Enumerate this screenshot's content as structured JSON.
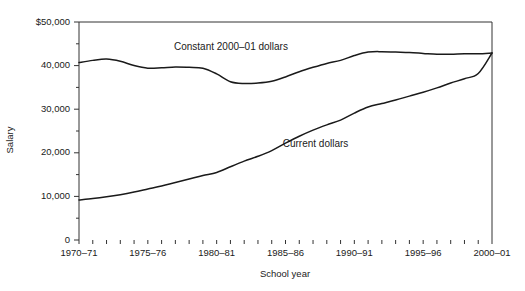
{
  "chart_data": {
    "type": "line",
    "title": "",
    "xlabel": "School year",
    "ylabel": "Salary",
    "ylim": [
      0,
      50000
    ],
    "grid": false,
    "legend_position": "inline-annotations",
    "y_tick_labels": [
      "$50,000",
      "40,000",
      "30,000",
      "20,000",
      "10,000",
      "0"
    ],
    "y_tick_values": [
      50000,
      40000,
      30000,
      20000,
      10000,
      0
    ],
    "y_minor_tick_values": [
      45000,
      35000,
      25000,
      15000,
      5000
    ],
    "x_tick_labels": [
      "1970–71",
      "1975–76",
      "1980–81",
      "1985–86",
      "1990–91",
      "1995–96",
      "2000–01"
    ],
    "x_tick_values": [
      1970,
      1975,
      1980,
      1985,
      1990,
      1995,
      2000
    ],
    "x": [
      1970,
      1971,
      1972,
      1973,
      1974,
      1975,
      1976,
      1977,
      1978,
      1979,
      1980,
      1981,
      1982,
      1983,
      1984,
      1985,
      1986,
      1987,
      1988,
      1989,
      1990,
      1991,
      1992,
      1993,
      1994,
      1995,
      1996,
      1997,
      1998,
      1999,
      2000
    ],
    "x_categories": [
      "1970–71",
      "1971–72",
      "1972–73",
      "1973–74",
      "1974–75",
      "1975–76",
      "1976–77",
      "1977–78",
      "1978–79",
      "1979–80",
      "1980–81",
      "1981–82",
      "1982–83",
      "1983–84",
      "1984–85",
      "1985–86",
      "1986–87",
      "1987–88",
      "1988–89",
      "1989–90",
      "1990–91",
      "1991–92",
      "1992–93",
      "1993–94",
      "1994–95",
      "1995–96",
      "1996–97",
      "1997–98",
      "1998–99",
      "1999–2000",
      "2000–01"
    ],
    "series": [
      {
        "name": "Constant 2000–01 dollars",
        "label_x": 1976.9,
        "label_y": 44200,
        "values": [
          40700,
          41200,
          41500,
          41000,
          40000,
          39400,
          39500,
          39700,
          39600,
          39400,
          38100,
          36300,
          35900,
          36000,
          36400,
          37400,
          38600,
          39600,
          40500,
          41200,
          42300,
          43100,
          43200,
          43100,
          43000,
          42800,
          42600,
          42600,
          42700,
          42700,
          42900
        ]
      },
      {
        "name": "Current dollars",
        "label_x": 1984.8,
        "label_y": 21900,
        "values": [
          9200,
          9500,
          9900,
          10400,
          11000,
          11700,
          12400,
          13200,
          14000,
          14800,
          15500,
          16800,
          18100,
          19200,
          20500,
          22200,
          23800,
          25200,
          26400,
          27500,
          29100,
          30500,
          31300,
          32100,
          33000,
          33900,
          34900,
          36000,
          37000,
          38200,
          42900
        ]
      }
    ]
  }
}
